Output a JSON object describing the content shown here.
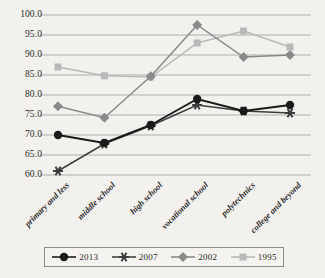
{
  "chart_data": {
    "type": "line",
    "title": "",
    "xlabel": "",
    "ylabel": "",
    "ylim": [
      60.0,
      100.0
    ],
    "ystep": 5.0,
    "grid": true,
    "legend_position": "bottom",
    "categories": [
      "primary and less",
      "middle school",
      "high school",
      "vocational school",
      "polytechnics",
      "college and beyond"
    ],
    "ytick_labels": [
      "100.0",
      "95.0",
      "90.0",
      "85.0",
      "80.0",
      "75.0",
      "70.0",
      "65.0",
      "60.0"
    ],
    "series": [
      {
        "name": "2013",
        "color": "#1a1a1a",
        "marker": "circle",
        "values": [
          70.0,
          68.0,
          72.5,
          79.0,
          76.0,
          77.5
        ]
      },
      {
        "name": "2007",
        "color": "#3d3d3d",
        "marker": "asterisk",
        "values": [
          61.0,
          67.8,
          72.3,
          77.5,
          76.0,
          75.5
        ]
      },
      {
        "name": "2002",
        "color": "#8a8a8a",
        "marker": "diamond",
        "values": [
          77.2,
          74.3,
          84.7,
          97.5,
          89.5,
          90.0
        ]
      },
      {
        "name": "1995",
        "color": "#b9b9b9",
        "marker": "square",
        "values": [
          87.0,
          84.8,
          84.5,
          93.0,
          96.0,
          92.0
        ]
      }
    ]
  },
  "legend": {
    "items": [
      {
        "label": "2013",
        "marker": "circle",
        "color": "#1a1a1a"
      },
      {
        "label": "2007",
        "marker": "asterisk",
        "color": "#3d3d3d"
      },
      {
        "label": "2002",
        "marker": "diamond",
        "color": "#8a8a8a"
      },
      {
        "label": "1995",
        "marker": "square",
        "color": "#b9b9b9"
      }
    ]
  }
}
